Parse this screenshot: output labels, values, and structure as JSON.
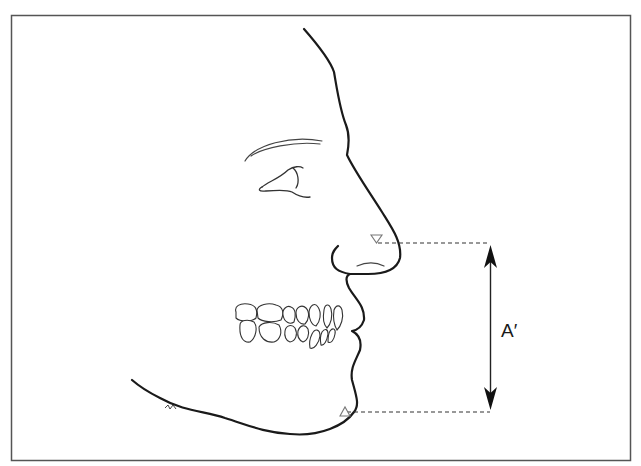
{
  "diagram": {
    "type": "facial-profile-measurement",
    "measurement_label": "A′",
    "landmarks": [
      {
        "name": "subnasale",
        "marker": "inverted-triangle"
      },
      {
        "name": "soft-tissue-menton",
        "marker": "triangle"
      }
    ],
    "colors": {
      "frame": "#555555",
      "line": "#1a1a1a",
      "marker": "#777777",
      "background": "#ffffff"
    }
  }
}
